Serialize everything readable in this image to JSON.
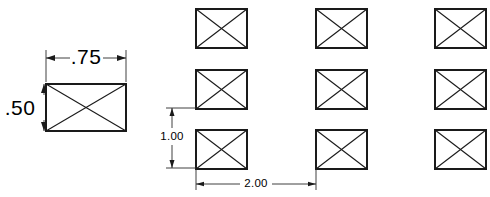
{
  "drawing": {
    "title": "Rectangular shape detail and 3x3 grid pattern layout",
    "units": "inches",
    "background_color": "#ffffff",
    "line_color": "#1a1a1a",
    "dimension_color": "#2b2b2b",
    "text_color": "#000000",
    "canvas": {
      "width": 490,
      "height": 197
    }
  },
  "detail_view": {
    "name": "detail-rectangle",
    "shape": "rectangle-with-diagonals",
    "rect": {
      "x": 46,
      "y": 84,
      "width": 80,
      "height": 47
    },
    "dimensions": {
      "width": {
        "label": ".75",
        "orientation": "horizontal",
        "line_y": 58,
        "from_x": 46,
        "to_x": 126,
        "text_x": 86,
        "text_y": 57
      },
      "height": {
        "label": ".50",
        "orientation": "vertical",
        "line_x": 44,
        "from_y": 84,
        "to_y": 131,
        "text_x": 20,
        "text_y": 110
      }
    }
  },
  "pattern_view": {
    "name": "grid-pattern",
    "rows": 3,
    "columns": 3,
    "cell": {
      "width": 51,
      "height": 39
    },
    "origins_x": [
      196,
      316,
      435
    ],
    "origins_y": [
      9,
      70,
      130
    ],
    "instances": [
      {
        "id": "r1c1",
        "x": 196,
        "y": 9
      },
      {
        "id": "r1c2",
        "x": 316,
        "y": 9
      },
      {
        "id": "r1c3",
        "x": 435,
        "y": 9
      },
      {
        "id": "r2c1",
        "x": 196,
        "y": 70
      },
      {
        "id": "r2c2",
        "x": 316,
        "y": 70
      },
      {
        "id": "r2c3",
        "x": 435,
        "y": 70
      },
      {
        "id": "r3c1",
        "x": 196,
        "y": 130
      },
      {
        "id": "r3c2",
        "x": 316,
        "y": 130
      },
      {
        "id": "r3c3",
        "x": 435,
        "y": 130
      }
    ],
    "dimensions": {
      "vertical_spacing": {
        "label": "1.00",
        "orientation": "vertical",
        "line_x": 172,
        "from_y": 108,
        "to_y": 168,
        "text_x": 172,
        "text_y": 136,
        "ext_from_x": 196,
        "ext_to_x": 166
      },
      "horizontal_spacing": {
        "label": "2.00",
        "orientation": "horizontal",
        "line_y": 184,
        "from_x": 196,
        "to_x": 316,
        "text_x": 256,
        "text_y": 183,
        "ext_from_y": 169,
        "ext_to_y": 190
      }
    }
  }
}
